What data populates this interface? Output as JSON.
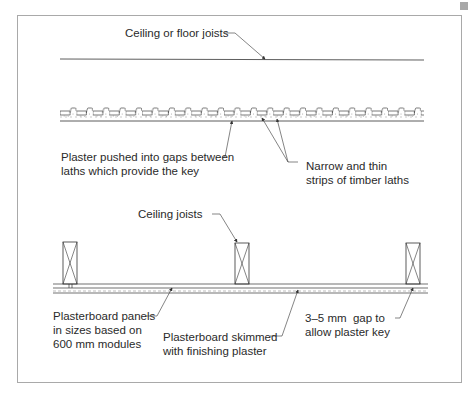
{
  "diagram": {
    "top_section": {
      "joist_label": "Ceiling or floor joists",
      "plaster_label_line1": "Plaster pushed into gaps between",
      "plaster_label_line2": "laths which provide the key",
      "laths_label_line1": "Narrow and thin",
      "laths_label_line2": "strips of timber laths"
    },
    "bottom_section": {
      "joists_label": "Ceiling joists",
      "panels_label_line1": "Plasterboard panels",
      "panels_label_line2": "in sizes based on",
      "panels_label_line3": "600 mm modules",
      "skim_label_line1": "Plasterboard skimmed",
      "skim_label_line2": "with finishing plaster",
      "gap_label_line1": "3–5 mm  gap to",
      "gap_label_line2": "allow plaster key"
    },
    "colors": {
      "line": "#333333",
      "frame": "#a9a9a9",
      "corner_mark": "#a8a8a8"
    }
  }
}
